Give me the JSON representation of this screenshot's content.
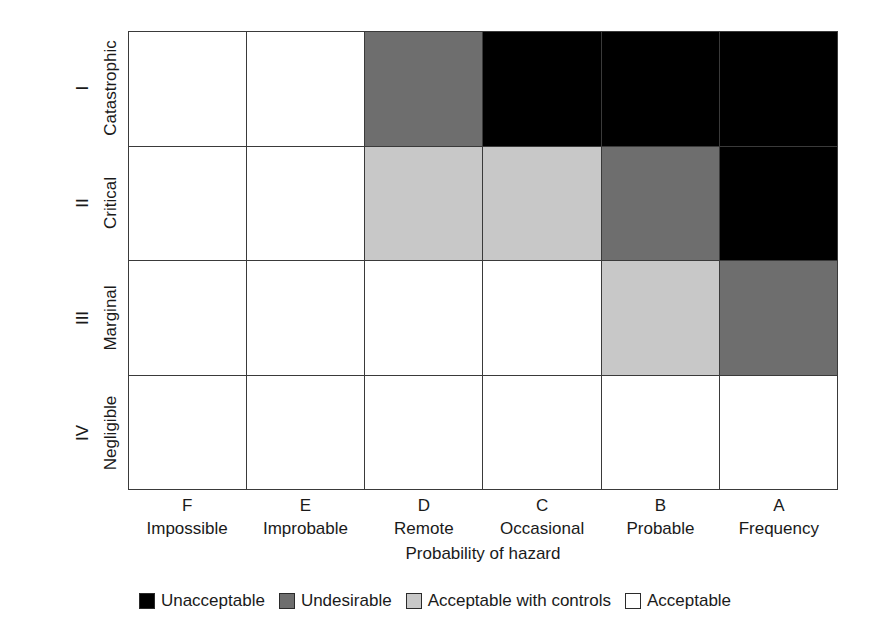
{
  "chart_data": {
    "type": "heatmap",
    "title": "",
    "xlabel": "Probability of hazard",
    "ylabel": "Severity of consequences",
    "grid": true,
    "legend_position": "bottom",
    "categories": [
      "F",
      "E",
      "D",
      "C",
      "B",
      "A"
    ],
    "x_tick_letters": [
      "F",
      "E",
      "D",
      "C",
      "B",
      "A"
    ],
    "x_tick_words": [
      "Impossible",
      "Improbable",
      "Remote",
      "Occasional",
      "Probable",
      "Frequency"
    ],
    "y_tick_romans": [
      "I",
      "II",
      "III",
      "IV"
    ],
    "y_tick_words": [
      "Catastrophic",
      "Critical",
      "Marginal",
      "Negligible"
    ],
    "risk_levels": [
      {
        "key": "unacceptable",
        "label": "Unacceptable",
        "color": "#000000"
      },
      {
        "key": "undesirable",
        "label": "Undesirable",
        "color": "#6e6e6e"
      },
      {
        "key": "acceptable_controls",
        "label": "Acceptable with controls",
        "color": "#c8c8c8"
      },
      {
        "key": "acceptable",
        "label": "Acceptable",
        "color": "#ffffff"
      }
    ],
    "rows": [
      {
        "roman": "I",
        "severity": "Catastrophic",
        "cells": [
          "acceptable",
          "acceptable",
          "undesirable",
          "unacceptable",
          "unacceptable",
          "unacceptable"
        ]
      },
      {
        "roman": "II",
        "severity": "Critical",
        "cells": [
          "acceptable",
          "acceptable",
          "acceptable_controls",
          "acceptable_controls",
          "undesirable",
          "unacceptable"
        ]
      },
      {
        "roman": "III",
        "severity": "Marginal",
        "cells": [
          "acceptable",
          "acceptable",
          "acceptable",
          "acceptable",
          "acceptable_controls",
          "undesirable"
        ]
      },
      {
        "roman": "IV",
        "severity": "Negligible",
        "cells": [
          "acceptable",
          "acceptable",
          "acceptable",
          "acceptable",
          "acceptable",
          "acceptable"
        ]
      }
    ]
  },
  "axes": {
    "y_title": "Severity of consequences",
    "x_title": "Probability of hazard"
  },
  "legend": {
    "items": [
      {
        "label": "Unacceptable",
        "color": "#000000"
      },
      {
        "label": "Undesirable",
        "color": "#6e6e6e"
      },
      {
        "label": "Acceptable with controls",
        "color": "#c8c8c8"
      },
      {
        "label": "Acceptable",
        "color": "#ffffff"
      }
    ]
  }
}
